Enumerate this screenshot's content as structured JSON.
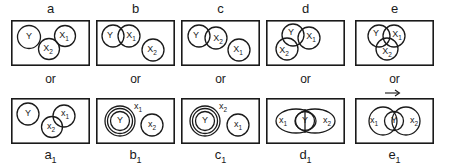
{
  "figure": {
    "kind": "euler-venn-diagram-grid",
    "columns": 5,
    "rows": 2,
    "connector_label": "or",
    "ink_color": "#1a1a1a",
    "background_color": "#ffffff"
  },
  "columns": [
    {
      "top_label": "a",
      "bottom_label": "a",
      "bottom_label_sub": "1",
      "or_label": "or",
      "top_panel": {
        "name": "panel-a",
        "set_labels": [
          "Y",
          "X",
          "X"
        ],
        "set_subs": [
          "",
          "1",
          "2"
        ],
        "description": "Y disjoint at left; X1 upper right touching X2 below it"
      },
      "bottom_panel": {
        "name": "panel-a1",
        "set_labels": [
          "Y",
          "x",
          "x"
        ],
        "set_subs": [
          "",
          "1",
          "2"
        ],
        "description": "Y disjoint at left; x1 and x2 overlap at right"
      }
    },
    {
      "top_label": "b",
      "bottom_label": "b",
      "bottom_label_sub": "1",
      "or_label": "or",
      "top_panel": {
        "name": "panel-b",
        "set_labels": [
          "Y",
          "X",
          "X"
        ],
        "set_subs": [
          "",
          "1",
          "2"
        ],
        "description": "Y overlaps X1 at left; X2 disjoint at lower right"
      },
      "bottom_panel": {
        "name": "panel-b1",
        "set_labels": [
          "Y",
          "x",
          "x"
        ],
        "set_subs": [
          "",
          "1",
          "2"
        ],
        "description": "Y nested inside x1; x2 disjoint at right"
      }
    },
    {
      "top_label": "c",
      "bottom_label": "c",
      "bottom_label_sub": "1",
      "or_label": "or",
      "top_panel": {
        "name": "panel-c",
        "set_labels": [
          "Y",
          "X",
          "X"
        ],
        "set_subs": [
          "",
          "2",
          "1"
        ],
        "description": "Y overlaps X2 at left; X1 disjoint at lower right"
      },
      "bottom_panel": {
        "name": "panel-c1",
        "set_labels": [
          "Y",
          "x",
          "x"
        ],
        "set_subs": [
          "",
          "2",
          "1"
        ],
        "description": "Y nested inside x2; x1 disjoint at right"
      }
    },
    {
      "top_label": "d",
      "bottom_label": "d",
      "bottom_label_sub": "1",
      "or_label": "or",
      "top_panel": {
        "name": "panel-d",
        "set_labels": [
          "Y",
          "X",
          "X"
        ],
        "set_subs": [
          "",
          "1",
          "2"
        ],
        "description": "Y top left overlaps X1 right and X2 lower left"
      },
      "bottom_panel": {
        "name": "panel-d1",
        "set_labels": [
          "x",
          "Y",
          "x"
        ],
        "set_subs": [
          "1",
          "",
          "2"
        ],
        "description": "Large x1 and x2 ellipses overlap; Y sits in the intersection"
      }
    },
    {
      "top_label": "e",
      "bottom_label": "e",
      "bottom_label_sub": "1",
      "or_label": "or",
      "top_panel": {
        "name": "panel-e",
        "set_labels": [
          "Y",
          "X",
          "X"
        ],
        "set_subs": [
          "",
          "1",
          "2"
        ],
        "description": "Three mutually overlapping circles Y, X1, X2"
      },
      "bottom_panel": {
        "name": "panel-e1",
        "set_labels": [
          "x",
          "Y",
          "x"
        ],
        "set_subs": [
          "1",
          "",
          "2"
        ],
        "has_arrow": true,
        "description": "x1 and x2 overlap with Y overlapping both in the centre"
      }
    }
  ]
}
